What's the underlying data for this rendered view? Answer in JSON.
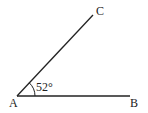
{
  "diagram": {
    "type": "angle",
    "points": {
      "A": {
        "label": "A",
        "x": 17,
        "y": 96
      },
      "B": {
        "label": "B",
        "x": 130,
        "y": 96
      },
      "C": {
        "label": "C",
        "x": 93,
        "y": 15
      }
    },
    "angle": {
      "vertex": "A",
      "label": "52°",
      "value_deg": 52
    },
    "segments": [
      [
        "A",
        "B"
      ],
      [
        "A",
        "C"
      ]
    ],
    "colors": {
      "line": "#222222",
      "background": "#ffffff"
    }
  }
}
